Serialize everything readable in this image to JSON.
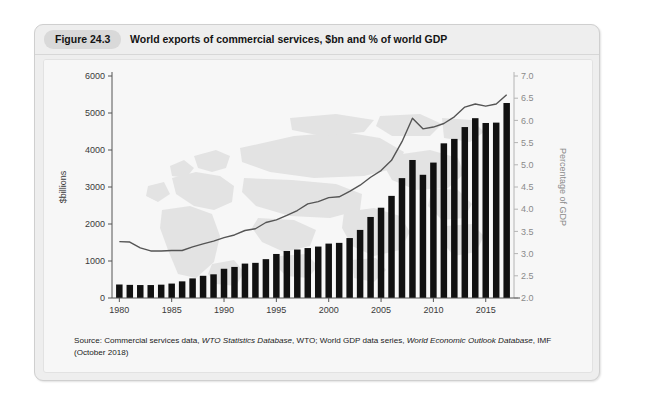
{
  "figure": {
    "badge": "Figure 24.3",
    "title": "World exports of commercial services, $bn and % of world GDP",
    "source_prefix": "Source: Commercial services data, ",
    "source_italic_1": "WTO Statistics Database",
    "source_mid": ", WTO; World GDP data series, ",
    "source_italic_2": "World Economic Outlook Database",
    "source_suffix": ", IMF (October 2018)"
  },
  "colors": {
    "bar": "#111111",
    "line": "#555555",
    "panel_bg": "#f7f7f7",
    "card_bg": "#eeeeee",
    "badge_bg": "#d9d9d9",
    "map_watermark": "#e3e3e3",
    "axis": "#555555",
    "right_axis_text": "#8a8a8a"
  },
  "chart_data": {
    "type": "bar",
    "title": "World exports of commercial services, $bn and % of world GDP",
    "xlabel": "",
    "ylabel": "$billions",
    "y2label": "Percentage of GDP",
    "ylim": [
      0,
      6000
    ],
    "y2lim": [
      2.0,
      7.0
    ],
    "grid": false,
    "legend": "none",
    "xlim": [
      1979.3,
      2017.7
    ],
    "xticks": [
      1980,
      1985,
      1990,
      1995,
      2000,
      2005,
      2010,
      2015
    ],
    "xticklabels": [
      "1980",
      "1985",
      "1990",
      "1995",
      "2000",
      "2005",
      "2010",
      "2015"
    ],
    "yticks": [
      0,
      1000,
      2000,
      3000,
      4000,
      5000,
      6000
    ],
    "yticklabels": [
      "0",
      "1000",
      "2000",
      "3000",
      "4000",
      "5000",
      "6000"
    ],
    "y2ticks": [
      2.0,
      2.5,
      3.0,
      3.5,
      4.0,
      4.5,
      5.0,
      5.5,
      6.0,
      6.5,
      7.0
    ],
    "y2ticklabels": [
      "2.0",
      "2.5",
      "3.0",
      "3.5",
      "4.0",
      "4.5",
      "5.0",
      "5.5",
      "6.0",
      "6.5",
      "7.0"
    ],
    "categories": [
      1980,
      1981,
      1982,
      1983,
      1984,
      1985,
      1986,
      1987,
      1988,
      1989,
      1990,
      1991,
      1992,
      1993,
      1994,
      1995,
      1996,
      1997,
      1998,
      1999,
      2000,
      2001,
      2002,
      2003,
      2004,
      2005,
      2006,
      2007,
      2008,
      2009,
      2010,
      2011,
      2012,
      2013,
      2014,
      2015,
      2016,
      2017
    ],
    "series": [
      {
        "name": "World exports of commercial services ($bn)",
        "type": "bar",
        "axis": "left",
        "unit": "$bn",
        "values": [
          365,
          355,
          350,
          350,
          360,
          390,
          450,
          530,
          600,
          640,
          790,
          840,
          930,
          950,
          1050,
          1190,
          1270,
          1310,
          1350,
          1390,
          1470,
          1490,
          1620,
          1840,
          2190,
          2440,
          2760,
          3240,
          3730,
          3330,
          3660,
          4180,
          4300,
          4620,
          4860,
          4730,
          4740,
          5270
        ]
      },
      {
        "name": "Commercial services exports as % of world GDP",
        "type": "line",
        "axis": "right",
        "unit": "%",
        "values": [
          3.27,
          3.26,
          3.13,
          3.06,
          3.06,
          3.07,
          3.07,
          3.15,
          3.22,
          3.28,
          3.36,
          3.42,
          3.52,
          3.56,
          3.7,
          3.76,
          3.86,
          3.97,
          4.12,
          4.17,
          4.26,
          4.28,
          4.4,
          4.54,
          4.72,
          4.87,
          5.1,
          5.52,
          6.05,
          5.81,
          5.85,
          5.93,
          6.08,
          6.3,
          6.37,
          6.32,
          6.37,
          6.58
        ]
      }
    ]
  }
}
